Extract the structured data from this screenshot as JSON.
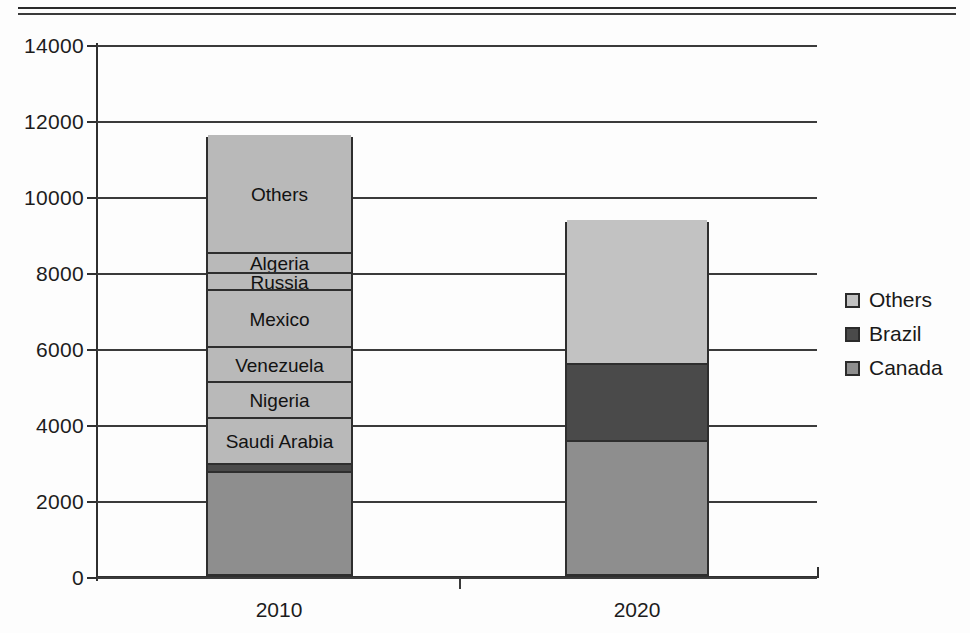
{
  "chart_data": {
    "type": "bar",
    "subtype": "stacked-vertical",
    "title": "",
    "xlabel": "",
    "ylabel": "",
    "categories": [
      "2010",
      "2020"
    ],
    "ylim": [
      0,
      14000
    ],
    "yticks": [
      0,
      2000,
      4000,
      6000,
      8000,
      10000,
      12000,
      14000
    ],
    "ytick_labels": [
      "0",
      "2000",
      "4000",
      "6000",
      "8000",
      "10000",
      "12000",
      "14000"
    ],
    "grid": true,
    "legend_position": "right",
    "totals": [
      11550,
      9320
    ],
    "bars": [
      {
        "category": "2010",
        "total": 11550,
        "segments": [
          {
            "name": "Canada",
            "value": 2650,
            "start": 0,
            "end": 2650,
            "color": "#8e8e8e",
            "label": ""
          },
          {
            "name": "Brazil",
            "value": 220,
            "start": 2650,
            "end": 2870,
            "color": "#4a4a4a",
            "label": ""
          },
          {
            "name": "Saudi Arabia",
            "value": 1210,
            "start": 2870,
            "end": 4080,
            "color": "#b9b9b9",
            "label": "Saudi Arabia"
          },
          {
            "name": "Nigeria",
            "value": 950,
            "start": 4080,
            "end": 5030,
            "color": "#b9b9b9",
            "label": "Nigeria"
          },
          {
            "name": "Venezuela",
            "value": 920,
            "start": 5030,
            "end": 5950,
            "color": "#b9b9b9",
            "label": "Venezuela"
          },
          {
            "name": "Mexico",
            "value": 1500,
            "start": 5950,
            "end": 7450,
            "color": "#b9b9b9",
            "label": "Mexico"
          },
          {
            "name": "Russia",
            "value": 450,
            "start": 7450,
            "end": 7900,
            "color": "#b9b9b9",
            "label": "Russia"
          },
          {
            "name": "Algeria",
            "value": 520,
            "start": 7900,
            "end": 8420,
            "color": "#b9b9b9",
            "label": "Algeria"
          },
          {
            "name": "Others",
            "value": 3130,
            "start": 8420,
            "end": 11550,
            "color": "#b9b9b9",
            "label": "Others"
          }
        ]
      },
      {
        "category": "2020",
        "total": 9320,
        "segments": [
          {
            "name": "Canada",
            "value": 3470,
            "start": 0,
            "end": 3470,
            "color": "#8e8e8e",
            "label": ""
          },
          {
            "name": "Brazil",
            "value": 2020,
            "start": 3470,
            "end": 5490,
            "color": "#4a4a4a",
            "label": ""
          },
          {
            "name": "Others",
            "value": 3830,
            "start": 5490,
            "end": 9320,
            "color": "#c2c2c2",
            "label": ""
          }
        ]
      }
    ],
    "legend": [
      {
        "label": "Others",
        "color": "#c2c2c2"
      },
      {
        "label": "Brazil",
        "color": "#4a4a4a"
      },
      {
        "label": "Canada",
        "color": "#8e8e8e"
      }
    ]
  }
}
